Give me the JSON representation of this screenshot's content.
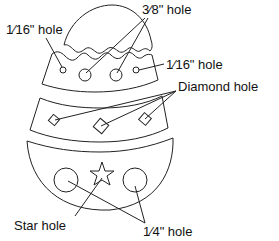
{
  "diagram": {
    "type": "labeled illustration",
    "colors": {
      "line": "#222222",
      "background": "#ffffff",
      "text": "#111111"
    },
    "labels": {
      "sixteenth_left": "1⁄16\" hole",
      "three_eighths": "3⁄8\" hole",
      "sixteenth_right": "1⁄16\" hole",
      "diamond": "Diamond hole",
      "star": "Star hole",
      "quarter": "1⁄4\" hole"
    },
    "pieces": [
      {
        "name": "top-cap",
        "holes": []
      },
      {
        "name": "upper-band",
        "holes": [
          "1/16\" hole",
          "3/8\" hole",
          "3/8\" hole",
          "1/16\" hole"
        ]
      },
      {
        "name": "middle-band",
        "holes": [
          "Diamond hole",
          "Diamond hole",
          "Diamond hole"
        ]
      },
      {
        "name": "bottom-bowl",
        "holes": [
          "1/4\" hole",
          "Star hole",
          "1/4\" hole"
        ]
      }
    ]
  }
}
